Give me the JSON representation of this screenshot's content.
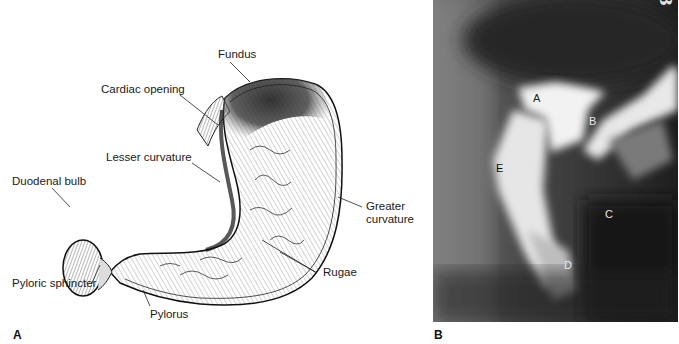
{
  "figure": {
    "panel_a": {
      "letter": "A",
      "labels": {
        "fundus": "Fundus",
        "cardiac_opening": "Cardiac opening",
        "lesser_curvature": "Lesser curvature",
        "duodenal_bulb": "Duodenal bulb",
        "greater_curvature_line1": "Greater",
        "greater_curvature_line2": "curvature",
        "rugae": "Rugae",
        "pyloric_sphincter": "Pyloric sphincter",
        "pylorus": "Pylorus"
      }
    },
    "panel_b": {
      "letter": "B",
      "film_number": "#103",
      "labels": {
        "a": "A",
        "b": "B",
        "c": "C",
        "d": "D",
        "e": "E"
      }
    }
  }
}
